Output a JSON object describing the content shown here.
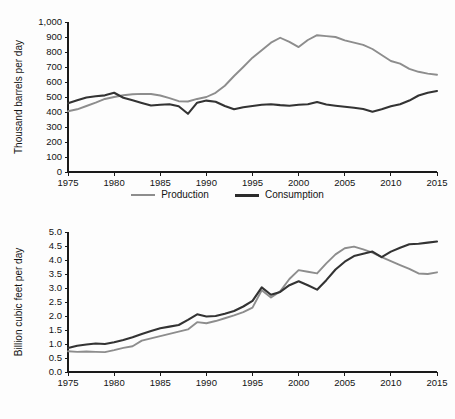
{
  "legend": {
    "production_label": "Production",
    "consumption_label": "Consumption"
  },
  "colors": {
    "production": "#8d8d8d",
    "consumption": "#2b2b2b",
    "axis": "#1a1a1a",
    "background": "#ffffff"
  },
  "chart_data": [
    {
      "id": "oil",
      "type": "line",
      "title": "",
      "xlabel": "",
      "ylabel": "Thousand barrels per day",
      "xlim": [
        1975,
        2015
      ],
      "ylim": [
        0,
        1000
      ],
      "xticks": [
        1975,
        1980,
        1985,
        1990,
        1995,
        2000,
        2005,
        2010,
        2015
      ],
      "xtick_labels": [
        "1975",
        "1980",
        "1985",
        "1990",
        "1995",
        "2000",
        "2005",
        "2010",
        "2015"
      ],
      "yticks": [
        0,
        100,
        200,
        300,
        400,
        500,
        600,
        700,
        800,
        900,
        1000
      ],
      "ytick_labels": [
        "0",
        "100",
        "200",
        "300",
        "400",
        "500",
        "600",
        "700",
        "800",
        "900",
        "1,000"
      ],
      "grid": false,
      "legend_position": "bottom",
      "x": [
        1975,
        1976,
        1977,
        1978,
        1979,
        1980,
        1981,
        1982,
        1983,
        1984,
        1985,
        1986,
        1987,
        1988,
        1989,
        1990,
        1991,
        1992,
        1993,
        1994,
        1995,
        1996,
        1997,
        1998,
        1999,
        2000,
        2001,
        2002,
        2003,
        2004,
        2005,
        2006,
        2007,
        2008,
        2009,
        2010,
        2011,
        2012,
        2013,
        2014,
        2015
      ],
      "series": [
        {
          "name": "Production",
          "values": [
            405,
            418,
            440,
            462,
            487,
            500,
            512,
            518,
            521,
            520,
            510,
            492,
            472,
            470,
            487,
            500,
            528,
            575,
            640,
            700,
            762,
            812,
            862,
            895,
            868,
            833,
            880,
            912,
            906,
            900,
            878,
            862,
            847,
            820,
            780,
            740,
            722,
            688,
            668,
            656,
            648
          ]
        },
        {
          "name": "Consumption",
          "values": [
            458,
            478,
            497,
            505,
            511,
            528,
            495,
            478,
            460,
            443,
            448,
            452,
            438,
            388,
            462,
            476,
            468,
            440,
            418,
            432,
            440,
            448,
            452,
            446,
            442,
            448,
            452,
            466,
            450,
            442,
            435,
            428,
            420,
            402,
            418,
            438,
            452,
            476,
            510,
            528,
            540
          ]
        }
      ]
    },
    {
      "id": "gas",
      "type": "line",
      "title": "",
      "xlabel": "",
      "ylabel": "Billion cubic feet per day",
      "xlim": [
        1975,
        2015
      ],
      "ylim": [
        0.0,
        5.0
      ],
      "xticks": [
        1975,
        1980,
        1985,
        1990,
        1995,
        2000,
        2005,
        2010,
        2015
      ],
      "xtick_labels": [
        "1975",
        "1980",
        "1985",
        "1990",
        "1995",
        "2000",
        "2005",
        "2010",
        "2015"
      ],
      "yticks": [
        0.0,
        0.5,
        1.0,
        1.5,
        2.0,
        2.5,
        3.0,
        3.5,
        4.0,
        4.5,
        5.0
      ],
      "ytick_labels": [
        "0.0",
        "0.5",
        "1.0",
        "1.5",
        "2.0",
        "2.5",
        "3.0",
        "3.5",
        "4.0",
        "4.5",
        "5.0"
      ],
      "grid": false,
      "legend_position": "bottom",
      "x": [
        1975,
        1976,
        1977,
        1978,
        1979,
        1980,
        1981,
        1982,
        1983,
        1984,
        1985,
        1986,
        1987,
        1988,
        1989,
        1990,
        1991,
        1992,
        1993,
        1994,
        1995,
        1996,
        1997,
        1998,
        1999,
        2000,
        2001,
        2002,
        2003,
        2004,
        2005,
        2006,
        2007,
        2008,
        2009,
        2010,
        2011,
        2012,
        2013,
        2014,
        2015
      ],
      "series": [
        {
          "name": "Production",
          "values": [
            0.74,
            0.72,
            0.73,
            0.72,
            0.71,
            0.78,
            0.86,
            0.92,
            1.12,
            1.2,
            1.28,
            1.36,
            1.44,
            1.52,
            1.78,
            1.74,
            1.82,
            1.92,
            2.02,
            2.14,
            2.3,
            2.92,
            2.66,
            2.88,
            3.32,
            3.64,
            3.58,
            3.52,
            3.88,
            4.2,
            4.42,
            4.48,
            4.38,
            4.26,
            4.1,
            3.96,
            3.82,
            3.68,
            3.52,
            3.5,
            3.56
          ]
        },
        {
          "name": "Consumption",
          "values": [
            0.86,
            0.94,
            0.98,
            1.02,
            1.0,
            1.06,
            1.14,
            1.24,
            1.36,
            1.46,
            1.56,
            1.62,
            1.68,
            1.86,
            2.06,
            1.98,
            2.0,
            2.08,
            2.18,
            2.34,
            2.54,
            3.02,
            2.76,
            2.86,
            3.1,
            3.24,
            3.1,
            2.94,
            3.28,
            3.66,
            3.94,
            4.14,
            4.22,
            4.3,
            4.1,
            4.3,
            4.44,
            4.56,
            4.58,
            4.62,
            4.66
          ]
        }
      ]
    }
  ]
}
